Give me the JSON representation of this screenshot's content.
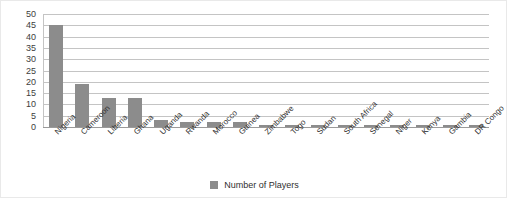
{
  "chart_data": {
    "type": "bar",
    "title": "",
    "xlabel": "",
    "ylabel": "",
    "ylim": [
      0,
      50
    ],
    "ytick_step": 5,
    "yticks": [
      50,
      45,
      40,
      35,
      30,
      25,
      20,
      15,
      10,
      5,
      0
    ],
    "grid": true,
    "legend_position": "bottom",
    "categories": [
      "Nigeria",
      "Cameroon",
      "Liberia",
      "Ghana",
      "Uganda",
      "Rwanda",
      "Morocco",
      "Guinea",
      "Zimbabwe",
      "Togo",
      "Sudan",
      "South Africa",
      "Senegal",
      "Niger",
      "Kenya",
      "Gambia",
      "DR Congo"
    ],
    "series": [
      {
        "name": "Number of Players",
        "color": "#8c8c8c",
        "values": [
          45,
          19,
          13,
          13,
          3,
          2,
          2,
          2,
          1,
          1,
          1,
          1,
          1,
          1,
          1,
          1,
          1
        ]
      }
    ]
  },
  "legend": {
    "marker_name": "legend-color-swatch",
    "label": "Number of Players",
    "color": "#8c8c8c"
  },
  "style": {
    "bar_color": "#8c8c8c",
    "gridline_color": "#c4c4c4",
    "axis_color": "#9a9a9a",
    "text_color": "#2f2f2f",
    "background": "#ffffff",
    "frame_border": "#e9e9e9"
  }
}
